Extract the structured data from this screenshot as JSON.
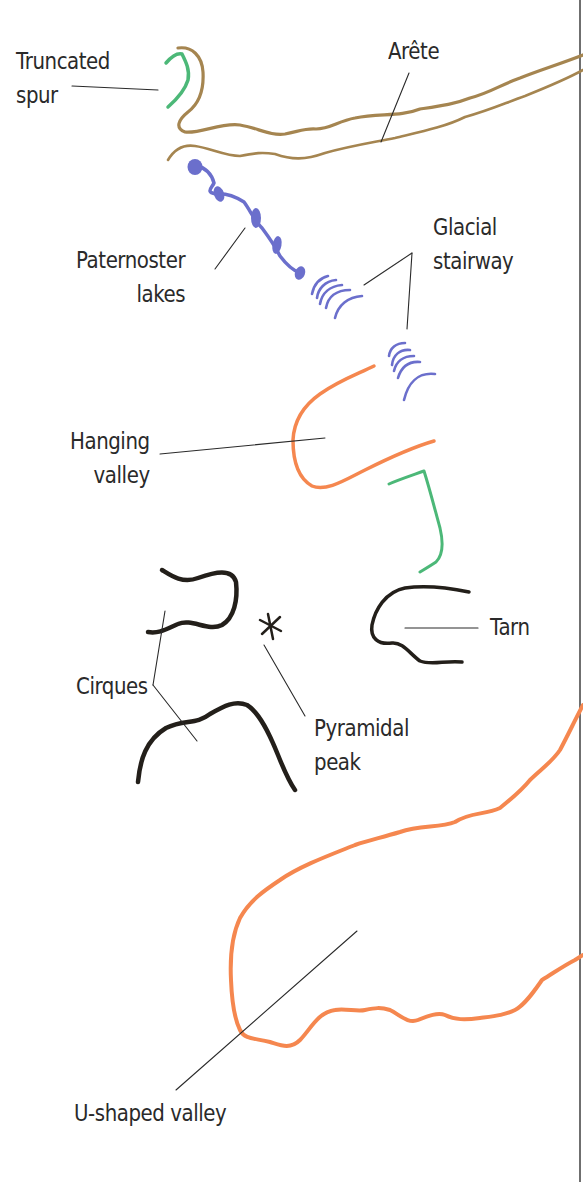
{
  "figure": {
    "type": "glacial-landforms-map-key",
    "colors": {
      "arete": "#a58550",
      "truncated_spur": "#4cb878",
      "paternoster_lakes": "#6b6fcc",
      "glacial_stairway": "#6b6fcc",
      "hanging_valley": "#f5874f",
      "u_shaped_valley": "#f5874f",
      "cirques": "#231f1a",
      "tarn": "#231f1a",
      "pyramidal_peak": "#231f1a",
      "leader_line": "#2a2a2a",
      "border": "#6f6f6f"
    }
  },
  "labels": {
    "truncated_spur": "Truncated\nspur",
    "arete": "Arête",
    "paternoster_lakes": "Paternoster\nlakes",
    "glacial_stairway": "Glacial\nstairway",
    "hanging_valley": "Hanging\nvalley",
    "tarn": "Tarn",
    "cirques": "Cirques",
    "pyramidal_peak": "Pyramidal\npeak",
    "u_shaped_valley": "U-shaped valley"
  },
  "symbols": {
    "pyramidal_peak_glyph": "asterisk"
  }
}
